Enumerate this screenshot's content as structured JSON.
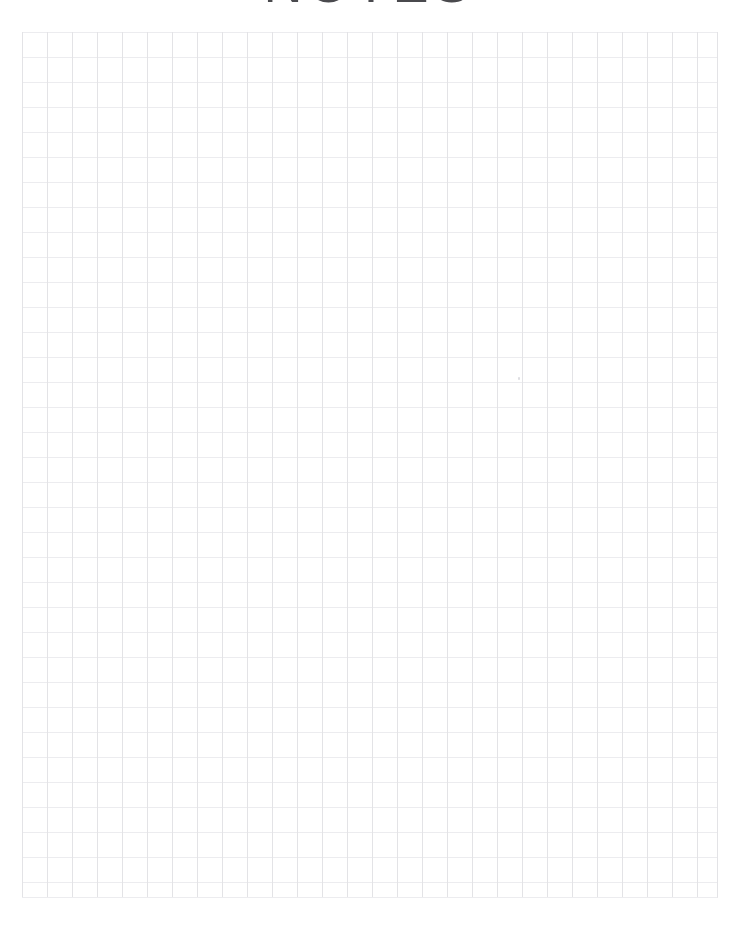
{
  "document": {
    "kind": "printable-graph-paper-notes-sheet",
    "title": "NOTES",
    "page": {
      "width": 738,
      "height": 927,
      "background_color": "#ffffff"
    },
    "title_style": {
      "font_size_px": 54,
      "letter_spacing_px": 5,
      "color": "#4a4a4e",
      "align": "center",
      "clipped_by_top_edge": true,
      "visible_height_px": 32
    },
    "grid": {
      "left": 22,
      "top": 32,
      "right": 718,
      "bottom": 898,
      "width": 696,
      "height": 866,
      "cell_size_px": 25,
      "columns": 28,
      "rows": 35,
      "vertical_line_color": "#e3e3e6",
      "horizontal_line_color": "#ececef",
      "line_width_px": 1,
      "grid_on": true
    },
    "margins": {
      "left_px": 22,
      "right_px": 20,
      "top_px": 32,
      "bottom_px": 29
    },
    "artifacts": [
      {
        "name": "print-speck",
        "x": 518,
        "y": 377,
        "width": 2,
        "height": 3,
        "color": "#dedee2"
      }
    ]
  }
}
